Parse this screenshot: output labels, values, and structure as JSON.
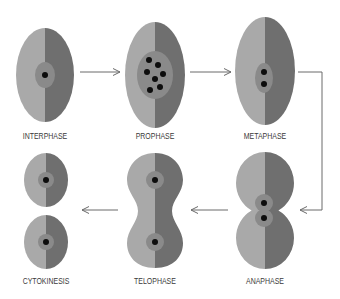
{
  "colors": {
    "cell_light": "#a9a9a9",
    "cell_dark": "#6f6f6f",
    "nucleus": "#8a8a8a",
    "chromosome": "#0d0d0d",
    "arrow": "#6a6a6a",
    "label": "#3a3a3a"
  },
  "stages": [
    {
      "id": "interphase",
      "label": "INTERPHASE",
      "chromosome_count": 1
    },
    {
      "id": "prophase",
      "label": "PROPHASE",
      "chromosome_count": 7
    },
    {
      "id": "metaphase",
      "label": "METAPHASE",
      "chromosome_count": 2
    },
    {
      "id": "anaphase",
      "label": "ANAPHASE",
      "chromosome_count": 2
    },
    {
      "id": "telophase",
      "label": "TELOPHASE",
      "chromosome_count": 2
    },
    {
      "id": "cytokinesis",
      "label": "CYTOKINESIS",
      "chromosome_count": 2
    }
  ],
  "flow": [
    {
      "from": "interphase",
      "to": "prophase"
    },
    {
      "from": "prophase",
      "to": "metaphase"
    },
    {
      "from": "metaphase",
      "to": "anaphase"
    },
    {
      "from": "anaphase",
      "to": "telophase"
    },
    {
      "from": "telophase",
      "to": "cytokinesis"
    }
  ]
}
